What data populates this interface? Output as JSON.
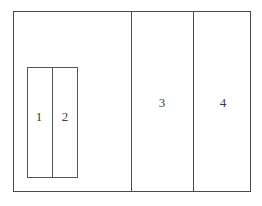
{
  "diagram": {
    "type": "partitioned-rectangle-plan",
    "background_color": "#ffffff",
    "line_color": "#4a4a4a",
    "inner_line_color": "#565656",
    "text_color": "#3b3b3b",
    "outer_frame": {
      "name": "outer-boundary",
      "x": 13,
      "y": 11,
      "width": 238,
      "height": 181
    },
    "partitions": [
      {
        "name": "partition-line-1",
        "x": 131
      },
      {
        "name": "partition-line-2",
        "x": 193
      }
    ],
    "inner_frame": {
      "name": "nested-boundary",
      "x": 27,
      "y": 67,
      "width": 51,
      "height": 111,
      "divider_x": 52
    },
    "regions": [
      {
        "id": "region-1",
        "label": "1",
        "container": "inner-frame"
      },
      {
        "id": "region-2",
        "label": "2",
        "container": "inner-frame"
      },
      {
        "id": "region-3",
        "label": "3",
        "container": "outer-frame"
      },
      {
        "id": "region-4",
        "label": "4",
        "container": "outer-frame"
      }
    ]
  }
}
